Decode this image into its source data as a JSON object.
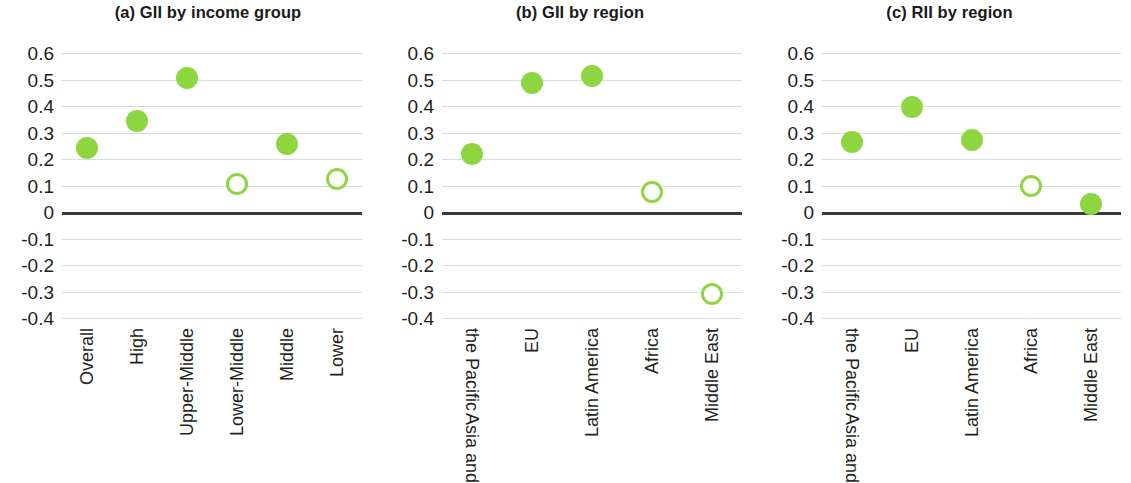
{
  "chart_data": [
    {
      "type": "scatter",
      "title": "(a) GII by income group",
      "xlabel": "",
      "ylabel": "",
      "ylim": [
        -0.4,
        0.6
      ],
      "ytick_labels": [
        "0.6",
        "0.5",
        "0.4",
        "0.3",
        "0.2",
        "0.1",
        "0",
        "-0.1",
        "-0.2",
        "-0.3",
        "-0.4"
      ],
      "ytick_values": [
        0.6,
        0.5,
        0.4,
        0.3,
        0.2,
        0.1,
        0,
        -0.1,
        -0.2,
        -0.3,
        -0.4
      ],
      "grid": true,
      "legend": "none",
      "categories": [
        "Overall",
        "High",
        "Upper-Middle",
        "Lower-Middle",
        "Middle",
        "Lower"
      ],
      "values": [
        0.24,
        0.345,
        0.505,
        0.105,
        0.255,
        0.125
      ],
      "significant": [
        true,
        true,
        true,
        false,
        true,
        false
      ],
      "marker_styles": [
        "filled",
        "filled",
        "filled",
        "hollow",
        "filled",
        "hollow"
      ]
    },
    {
      "type": "scatter",
      "title": "(b) GII by region",
      "xlabel": "",
      "ylabel": "",
      "ylim": [
        -0.4,
        0.6
      ],
      "ytick_labels": [
        "0.6",
        "0.5",
        "0.4",
        "0.3",
        "0.2",
        "0.1",
        "0",
        "-0.1",
        "-0.2",
        "-0.3",
        "-0.4"
      ],
      "ytick_values": [
        0.6,
        0.5,
        0.4,
        0.3,
        0.2,
        0.1,
        0,
        -0.1,
        -0.2,
        -0.3,
        -0.4
      ],
      "grid": true,
      "legend": "none",
      "categories": [
        "Asia and the Pacific",
        "EU",
        "Latin America",
        "Africa",
        "Middle East"
      ],
      "category_lines": [
        [
          "Asia and",
          "the Pacific"
        ],
        [
          "EU"
        ],
        [
          "Latin America"
        ],
        [
          "Africa"
        ],
        [
          "Middle East"
        ]
      ],
      "values": [
        0.22,
        0.485,
        0.515,
        0.075,
        -0.31
      ],
      "significant": [
        true,
        true,
        true,
        false,
        false
      ],
      "marker_styles": [
        "filled",
        "filled",
        "filled",
        "hollow",
        "hollow"
      ]
    },
    {
      "type": "scatter",
      "title": "(c) RII by region",
      "xlabel": "",
      "ylabel": "",
      "ylim": [
        -0.4,
        0.6
      ],
      "ytick_labels": [
        "0.6",
        "0.5",
        "0.4",
        "0.3",
        "0.2",
        "0.1",
        "0",
        "-0.1",
        "-0.2",
        "-0.3",
        "-0.4"
      ],
      "ytick_values": [
        0.6,
        0.5,
        0.4,
        0.3,
        0.2,
        0.1,
        0,
        -0.1,
        -0.2,
        -0.3,
        -0.4
      ],
      "grid": true,
      "legend": "none",
      "categories": [
        "Asia and the Pacific",
        "EU",
        "Latin America",
        "Africa",
        "Middle East"
      ],
      "category_lines": [
        [
          "Asia and",
          "the Pacific"
        ],
        [
          "EU"
        ],
        [
          "Latin America"
        ],
        [
          "Africa"
        ],
        [
          "Middle East"
        ]
      ],
      "values": [
        0.265,
        0.395,
        0.27,
        0.1,
        0.03
      ],
      "significant": [
        true,
        true,
        true,
        false,
        true
      ],
      "marker_styles": [
        "filled",
        "filled",
        "filled",
        "hollow",
        "filled"
      ]
    }
  ],
  "style": {
    "marker_color": "#8ed63f",
    "grid_color": "#d7dde4",
    "zero_axis_color": "#3a3a3a",
    "text_color": "#231f20"
  }
}
